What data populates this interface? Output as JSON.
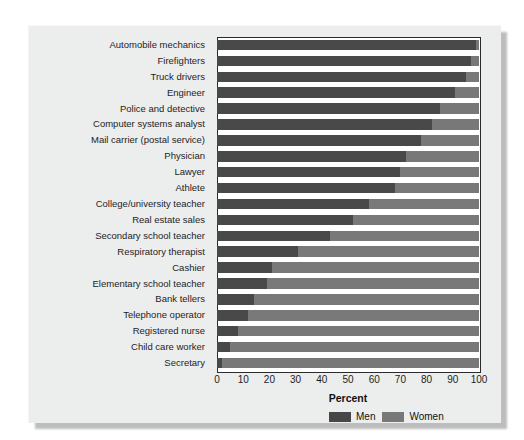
{
  "chart_data": {
    "type": "bar",
    "orientation": "horizontal",
    "stacked": true,
    "title": "",
    "xlabel": "Percent",
    "ylabel": "",
    "xlim": [
      0,
      100
    ],
    "xticks": [
      0,
      10,
      20,
      30,
      40,
      50,
      60,
      70,
      80,
      90,
      100
    ],
    "xticklabels": [
      "0",
      "10",
      "20",
      "30",
      "40",
      "50",
      "60",
      "70",
      "80",
      "90",
      "100"
    ],
    "grid": false,
    "legend_position": "bottom-right",
    "legend": [
      "Men",
      "Women"
    ],
    "colors": {
      "men": "#474747",
      "women": "#787878"
    },
    "categories": [
      "Automobile mechanics",
      "Firefighters",
      "Truck drivers",
      "Engineer",
      "Police and detective",
      "Computer systems analyst",
      "Mail carrier (postal service)",
      "Physician",
      "Lawyer",
      "Athlete",
      "College/university teacher",
      "Real estate sales",
      "Secondary school teacher",
      "Respiratory therapist",
      "Cashier",
      "Elementary school teacher",
      "Bank tellers",
      "Telephone operator",
      "Registered nurse",
      "Child care worker",
      "Secretary"
    ],
    "series": [
      {
        "name": "Men",
        "values": [
          99,
          97,
          95,
          91,
          85,
          82,
          78,
          72,
          70,
          68,
          58,
          52,
          43,
          31,
          21,
          19,
          14,
          12,
          8,
          5,
          2
        ]
      },
      {
        "name": "Women",
        "values": [
          1,
          3,
          5,
          9,
          15,
          18,
          22,
          28,
          30,
          32,
          42,
          48,
          57,
          69,
          79,
          81,
          86,
          88,
          92,
          95,
          98
        ]
      }
    ]
  },
  "axis": {
    "x_title": "Percent"
  },
  "legend": {
    "items": [
      {
        "label": "Men",
        "color": "#474747"
      },
      {
        "label": "Women",
        "color": "#787878"
      }
    ]
  }
}
